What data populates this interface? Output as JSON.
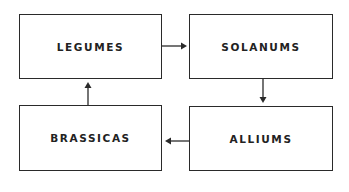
{
  "diagram": {
    "type": "crop-rotation-cycle",
    "nodes": [
      {
        "id": "legumes",
        "label": "LEGUMES"
      },
      {
        "id": "solanums",
        "label": "SOLANUMS"
      },
      {
        "id": "alliums",
        "label": "ALLIUMS"
      },
      {
        "id": "brassicas",
        "label": "BRASSICAS"
      }
    ],
    "edges": [
      {
        "from": "legumes",
        "to": "solanums"
      },
      {
        "from": "solanums",
        "to": "alliums"
      },
      {
        "from": "alliums",
        "to": "brassicas"
      },
      {
        "from": "brassicas",
        "to": "legumes"
      }
    ],
    "colors": {
      "stroke": "#2a2a2a",
      "text": "#222222",
      "background": "#ffffff"
    }
  }
}
